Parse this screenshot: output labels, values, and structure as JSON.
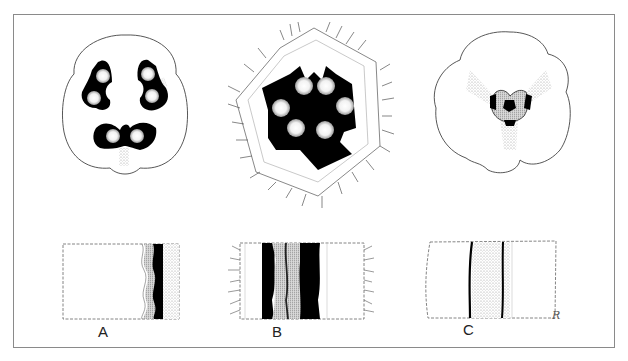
{
  "figure": {
    "panels": [
      {
        "id": "A",
        "label": "A",
        "top_view": "rounded lobed cross-section with three paired dark bilobed structures",
        "bottom_view": "longitudinal section with wavy dark band near right edge"
      },
      {
        "id": "B",
        "label": "B",
        "top_view": "hexagonal hairy cross-section with large central dark star-shaped region and six stippled lobes",
        "bottom_view": "longitudinal section with two dark bands and hairs on both sides"
      },
      {
        "id": "C",
        "label": "C",
        "top_view": "five-lobed rounded cross-section with small central dark region",
        "bottom_view": "longitudinal section with thin dark lines around stippled band"
      }
    ],
    "signature": "R"
  },
  "colors": {
    "ink": "#000000",
    "outline": "#444444",
    "stipple": "#9a9a9a",
    "frame": "#8a8a8a",
    "background": "#ffffff"
  }
}
